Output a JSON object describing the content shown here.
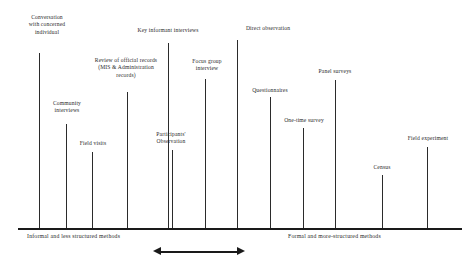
{
  "diagram": {
    "axis": {
      "left_end_label": "Informal and less structured methods",
      "right_end_label": "Formal and more-structured methods",
      "x_start": 18,
      "x_end": 462,
      "y": 228,
      "color": "#1a1a1a"
    },
    "arrow": {
      "name": "double-headed-arrow",
      "x": 153,
      "y": 247,
      "width": 92
    },
    "methods": [
      {
        "label": "Conversation\nwith concerned\nindividual",
        "tick_x": 39,
        "tick_top": 53,
        "label_x": 14,
        "label_y": 14,
        "label_width": 66
      },
      {
        "label": "Community\ninterviews",
        "tick_x": 66,
        "tick_top": 124,
        "label_x": 38,
        "label_y": 100,
        "label_width": 58
      },
      {
        "label": "Field visits",
        "tick_x": 92,
        "tick_top": 152,
        "label_x": 67,
        "label_y": 140,
        "label_width": 52
      },
      {
        "label": "Review of official records\n(MIS & Administration\nrecords)",
        "tick_x": 127,
        "tick_top": 92,
        "label_x": 73,
        "label_y": 57,
        "label_width": 106
      },
      {
        "label": "Key informant interviews",
        "tick_x": 168,
        "tick_top": 43,
        "label_x": 112,
        "label_y": 27,
        "label_width": 112
      },
      {
        "label": "Participants'\nObservation",
        "tick_x": 172,
        "tick_top": 150,
        "label_x": 140,
        "label_y": 131,
        "label_width": 62
      },
      {
        "label": "Focus group\ninterview",
        "tick_x": 205,
        "tick_top": 79,
        "label_x": 178,
        "label_y": 58,
        "label_width": 58
      },
      {
        "label": "Direct observation",
        "tick_x": 237,
        "tick_top": 40,
        "label_x": 228,
        "label_y": 25,
        "label_width": 80
      },
      {
        "label": "Questionnaires",
        "tick_x": 270,
        "tick_top": 97,
        "label_x": 237,
        "label_y": 87,
        "label_width": 66
      },
      {
        "label": "One-time survey",
        "tick_x": 303,
        "tick_top": 128,
        "label_x": 270,
        "label_y": 117,
        "label_width": 68
      },
      {
        "label": "Panel surveys",
        "tick_x": 335,
        "tick_top": 80,
        "label_x": 304,
        "label_y": 68,
        "label_width": 62
      },
      {
        "label": "Census",
        "tick_x": 382,
        "tick_top": 175,
        "label_x": 360,
        "label_y": 164,
        "label_width": 44
      },
      {
        "label": "Field experiment",
        "tick_x": 427,
        "tick_top": 147,
        "label_x": 394,
        "label_y": 135,
        "label_width": 68
      }
    ]
  }
}
